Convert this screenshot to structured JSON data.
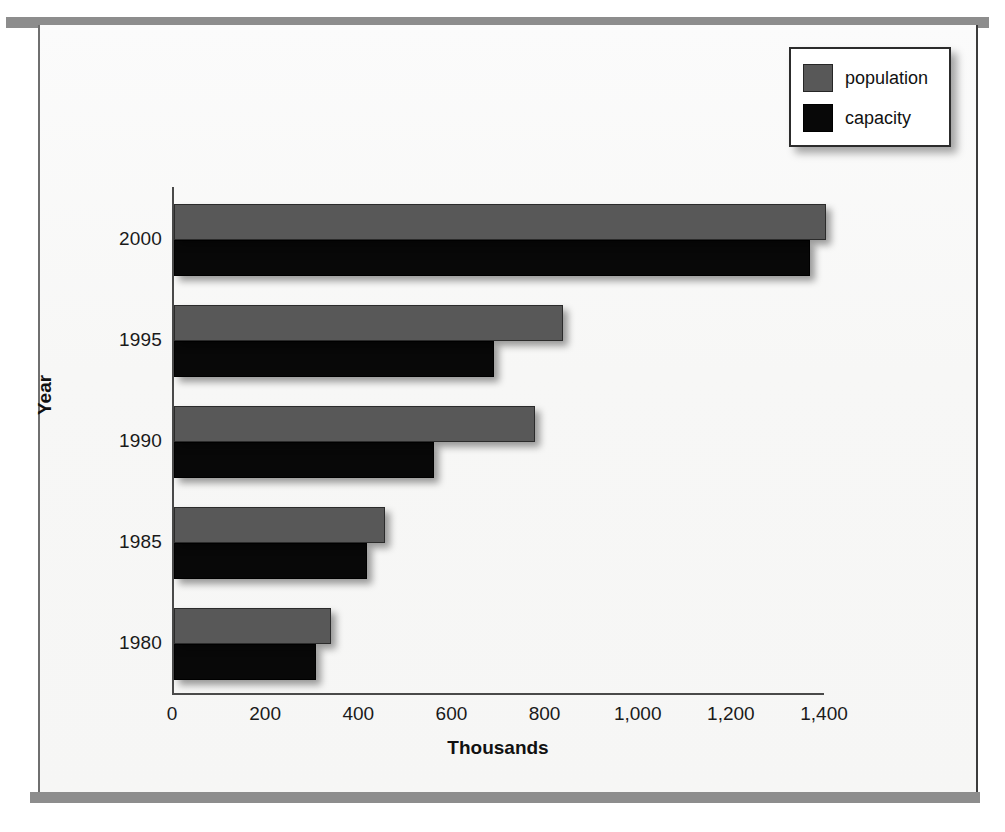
{
  "chart_data": {
    "type": "bar",
    "orientation": "horizontal",
    "title": "",
    "xlabel": "Thousands",
    "ylabel": "Year",
    "categories": [
      "1980",
      "1985",
      "1990",
      "1995",
      "2000"
    ],
    "series": [
      {
        "name": "population",
        "color": "#585858",
        "values": [
          338,
          454,
          776,
          836,
          1400
        ]
      },
      {
        "name": "capacity",
        "color": "#080808",
        "values": [
          305,
          415,
          559,
          688,
          1365
        ]
      }
    ],
    "xlim": [
      0,
      1400
    ],
    "xticks": [
      0,
      200,
      400,
      600,
      800,
      1000,
      1200,
      1400
    ],
    "xtick_labels": [
      "0",
      "200",
      "400",
      "600",
      "800",
      "1,000",
      "1,200",
      "1,400"
    ],
    "grid": false,
    "legend_position": "top-right",
    "category_order_top_to_bottom": [
      "2000",
      "1995",
      "1990",
      "1985",
      "1980"
    ]
  },
  "legend": {
    "items": [
      {
        "label": "population",
        "color": "#585858"
      },
      {
        "label": "capacity",
        "color": "#080808"
      }
    ]
  },
  "axes": {
    "y_title": "Year",
    "x_title": "Thousands"
  },
  "colors": {
    "population": "#585858",
    "capacity": "#080808",
    "rule_bar": "#8d8d8d",
    "axis": "#4a4a4a",
    "page": "#f7f7f6"
  }
}
